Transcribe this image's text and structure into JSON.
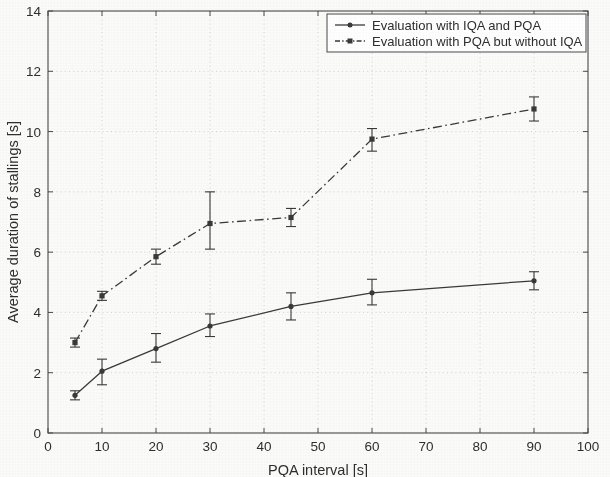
{
  "chart_data": {
    "type": "line",
    "title": "",
    "xlabel": "PQA interval [s]",
    "ylabel": "Average duration of stallings [s]",
    "xlim": [
      0,
      100
    ],
    "ylim": [
      0,
      14
    ],
    "xticks": [
      0,
      10,
      20,
      30,
      40,
      50,
      60,
      70,
      80,
      90,
      100
    ],
    "yticks": [
      0,
      2,
      4,
      6,
      8,
      10,
      12,
      14
    ],
    "xtick_labels": [
      "0",
      "10",
      "20",
      "30",
      "40",
      "50",
      "60",
      "70",
      "80",
      "90",
      "100"
    ],
    "ytick_labels": [
      "0",
      "2",
      "4",
      "6",
      "8",
      "10",
      "12",
      "14"
    ],
    "grid": true,
    "legend_position": "top-right",
    "x": [
      5,
      10,
      20,
      30,
      45,
      60,
      90
    ],
    "series": [
      {
        "name": "Evaluation with IQA and PQA",
        "style": "solid",
        "marker": "dot",
        "color": "#3a3a3a",
        "values": [
          1.25,
          2.05,
          2.8,
          3.55,
          4.2,
          4.65,
          5.05
        ],
        "err_low": [
          1.1,
          1.6,
          2.35,
          3.2,
          3.75,
          4.25,
          4.75
        ],
        "err_high": [
          1.4,
          2.45,
          3.3,
          3.95,
          4.65,
          5.1,
          5.35
        ]
      },
      {
        "name": "Evaluation with PQA but without IQA",
        "style": "dash-dot",
        "marker": "square",
        "color": "#3a3a3a",
        "values": [
          3.0,
          4.55,
          5.85,
          6.95,
          7.15,
          9.75,
          10.75
        ],
        "err_low": [
          2.85,
          4.4,
          5.6,
          6.1,
          6.85,
          9.35,
          10.35
        ],
        "err_high": [
          3.15,
          4.7,
          6.1,
          8.0,
          7.45,
          10.1,
          11.15
        ]
      }
    ]
  },
  "legend": {
    "items": [
      {
        "label": "Evaluation with IQA and PQA"
      },
      {
        "label": "Evaluation with PQA but without IQA"
      }
    ]
  }
}
